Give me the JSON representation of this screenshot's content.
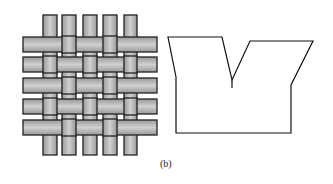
{
  "figure": {
    "caption": "(b)",
    "left_panel": {
      "name": "plain-weave-pattern",
      "fill": "#b8b8b8",
      "stroke": "#222222"
    },
    "right_panel": {
      "name": "notched-outline-shape",
      "stroke": "#111111"
    }
  }
}
